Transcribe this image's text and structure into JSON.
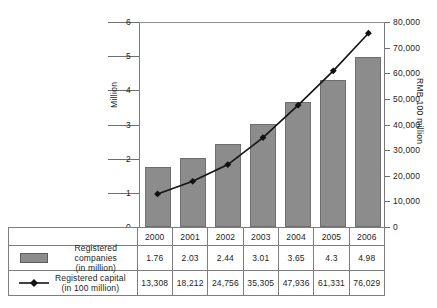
{
  "chart_data": {
    "type": "bar",
    "title": "",
    "subtitle": "",
    "categories": [
      "2000",
      "2001",
      "2002",
      "2003",
      "2004",
      "2005",
      "2006"
    ],
    "xlabel": "",
    "grid": false,
    "legend_position": "bottom-table",
    "series": [
      {
        "name": "Registered companies",
        "unit": "in million",
        "type": "bar",
        "axis": "left",
        "color": "#8c8c8c",
        "values": [
          1.76,
          2.03,
          2.44,
          3.01,
          3.65,
          4.3,
          4.98
        ],
        "value_labels": [
          "1.76",
          "2.03",
          "2.44",
          "3.01",
          "3.65",
          "4.3",
          "4.98"
        ]
      },
      {
        "name": "Registered capital",
        "unit": "in 100 million",
        "type": "line",
        "axis": "right",
        "color": "#111111",
        "marker": "diamond",
        "values": [
          13308,
          18212,
          24756,
          35305,
          47936,
          61331,
          76029
        ],
        "value_labels": [
          "13,308",
          "18,212",
          "24,756",
          "35,305",
          "47,936",
          "61,331",
          "76,029"
        ]
      }
    ],
    "left_axis": {
      "label": "Million",
      "ylim": [
        0,
        6
      ],
      "ticks": [
        0,
        1,
        2,
        3,
        4,
        5,
        6
      ],
      "tick_labels": [
        "0",
        "1",
        "2",
        "3",
        "4",
        "5",
        "6"
      ]
    },
    "right_axis": {
      "label": "RMB 100 million",
      "ylim": [
        0,
        80000
      ],
      "ticks": [
        0,
        10000,
        20000,
        30000,
        40000,
        50000,
        60000,
        70000,
        80000
      ],
      "tick_labels": [
        "0",
        "10,000",
        "20,000",
        "30,000",
        "40,000",
        "50,000",
        "60,000",
        "70,000",
        "80,000"
      ]
    }
  },
  "table": {
    "years": [
      "2000",
      "2001",
      "2002",
      "2003",
      "2004",
      "2005",
      "2006"
    ],
    "rows": [
      {
        "key": "bar-swatch",
        "label_line1": "Registered companies",
        "label_line2": "(in million)",
        "values": [
          "1.76",
          "2.03",
          "2.44",
          "3.01",
          "3.65",
          "4.3",
          "4.98"
        ]
      },
      {
        "key": "line-marker",
        "label_line1": "Registered capital",
        "label_line2": "(in 100 million)",
        "values": [
          "13,308",
          "18,212",
          "24,756",
          "35,305",
          "47,936",
          "61,331",
          "76,029"
        ]
      }
    ]
  }
}
